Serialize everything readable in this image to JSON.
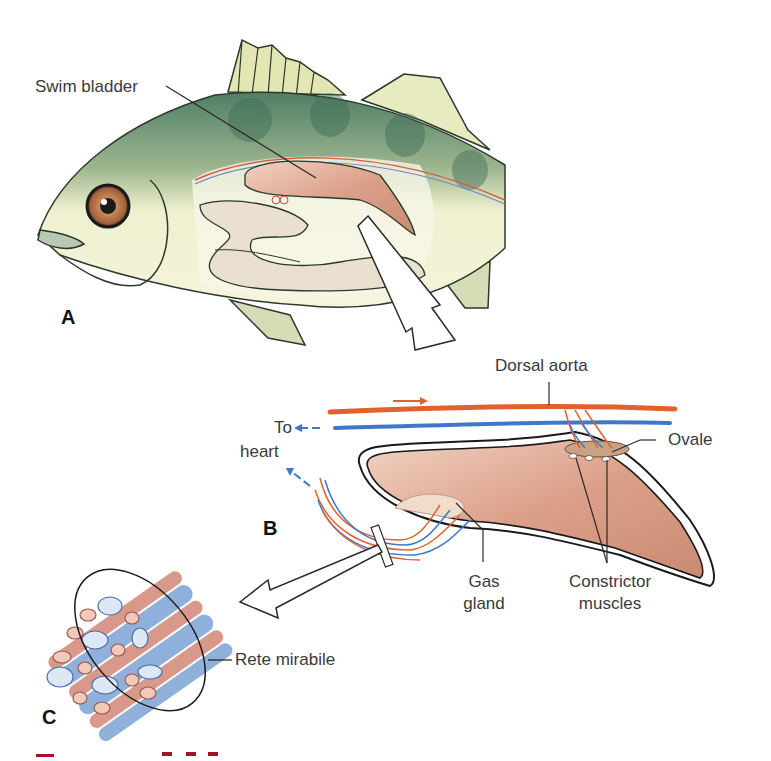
{
  "figure": {
    "panels": {
      "a": "A",
      "b": "B",
      "c": "C"
    },
    "labels": {
      "swim_bladder": "Swim bladder",
      "dorsal_aorta": "Dorsal aorta",
      "to_heart_line1": "To",
      "to_heart_line2": "heart",
      "ovale": "Ovale",
      "gas_gland_line1": "Gas",
      "gas_gland_line2": "gland",
      "constrictor_line1": "Constrictor",
      "constrictor_line2": "muscles",
      "rete_mirabile": "Rete mirabile"
    },
    "colors": {
      "artery": "#e0622e",
      "vein": "#3f78c8",
      "bladder": "#d9a08a",
      "fish_body": "#eef0cf",
      "fish_dark": "#5d8a6e",
      "outline": "#1a1a1a",
      "caption": "#a8102a"
    },
    "caption_visible": "cropped"
  }
}
